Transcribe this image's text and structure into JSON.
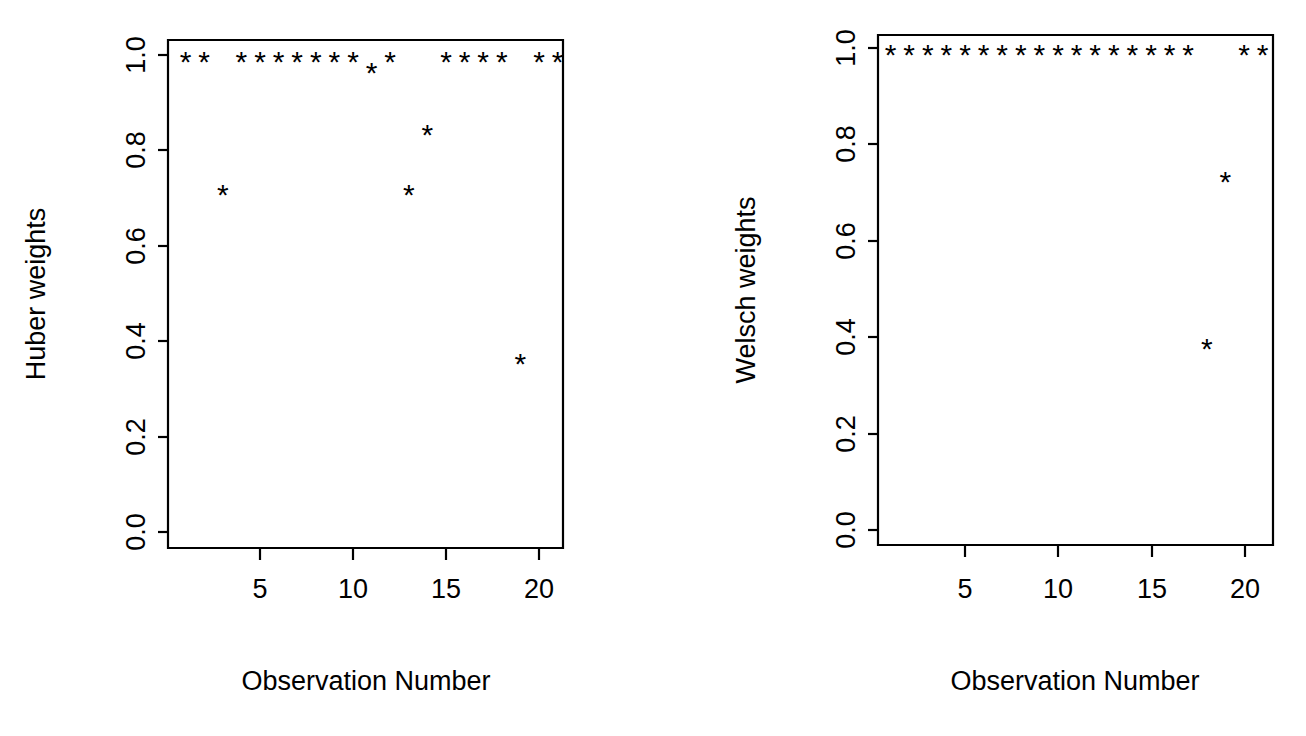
{
  "figure": {
    "background_color": "#ffffff",
    "foreground_color": "#000000",
    "panel_count": 2
  },
  "chart_data": [
    {
      "type": "scatter",
      "panel": "left",
      "title": "",
      "xlabel": "Observation Number",
      "ylabel": "Huber weights",
      "xlim": [
        0.3,
        21.7
      ],
      "ylim": [
        0.0,
        1.0
      ],
      "xticks": [
        5,
        10,
        15,
        20
      ],
      "xticklabels": [
        "5",
        "10",
        "15",
        "20"
      ],
      "yticks": [
        0.0,
        0.2,
        0.4,
        0.6,
        0.8,
        1.0
      ],
      "yticklabels": [
        "0.0",
        "0.2",
        "0.4",
        "0.6",
        "0.8",
        "1.0"
      ],
      "grid": false,
      "legend": false,
      "marker": "*",
      "x": [
        1,
        2,
        3,
        4,
        5,
        6,
        7,
        8,
        9,
        10,
        11,
        12,
        13,
        14,
        15,
        16,
        17,
        18,
        19,
        20,
        21
      ],
      "y": [
        1.0,
        1.0,
        0.72,
        1.0,
        1.0,
        1.0,
        1.0,
        1.0,
        1.0,
        1.0,
        0.975,
        1.0,
        0.72,
        0.845,
        1.0,
        1.0,
        1.0,
        1.0,
        0.365,
        1.0,
        1.0
      ]
    },
    {
      "type": "scatter",
      "panel": "right",
      "title": "",
      "xlabel": "Observation Number",
      "ylabel": "Welsch weights",
      "xlim": [
        0.3,
        21.7
      ],
      "ylim": [
        0.0,
        1.0
      ],
      "xticks": [
        5,
        10,
        15,
        20
      ],
      "xticklabels": [
        "5",
        "10",
        "15",
        "20"
      ],
      "yticks": [
        0.0,
        0.2,
        0.4,
        0.6,
        0.8,
        1.0
      ],
      "yticklabels": [
        "0.0",
        "0.2",
        "0.4",
        "0.6",
        "0.8",
        "1.0"
      ],
      "grid": false,
      "legend": false,
      "marker": "*",
      "x": [
        1,
        2,
        3,
        4,
        5,
        6,
        7,
        8,
        9,
        10,
        11,
        12,
        13,
        14,
        15,
        16,
        17,
        18,
        19,
        20,
        21
      ],
      "y": [
        1.0,
        1.0,
        1.0,
        1.0,
        1.0,
        1.0,
        1.0,
        1.0,
        1.0,
        1.0,
        1.0,
        1.0,
        1.0,
        1.0,
        1.0,
        1.0,
        1.0,
        0.39,
        0.735,
        1.0,
        1.0
      ]
    }
  ],
  "panels": {
    "left": {
      "y_axis_title": "Huber weights",
      "x_axis_title": "Observation Number",
      "x_tick_labels": [
        "5",
        "10",
        "15",
        "20"
      ],
      "y_tick_labels": [
        "0.0",
        "0.2",
        "0.4",
        "0.6",
        "0.8",
        "1.0"
      ]
    },
    "right": {
      "y_axis_title": "Welsch weights",
      "x_axis_title": "Observation Number",
      "x_tick_labels": [
        "5",
        "10",
        "15",
        "20"
      ],
      "y_tick_labels": [
        "0.0",
        "0.2",
        "0.4",
        "0.6",
        "0.8",
        "1.0"
      ]
    }
  }
}
